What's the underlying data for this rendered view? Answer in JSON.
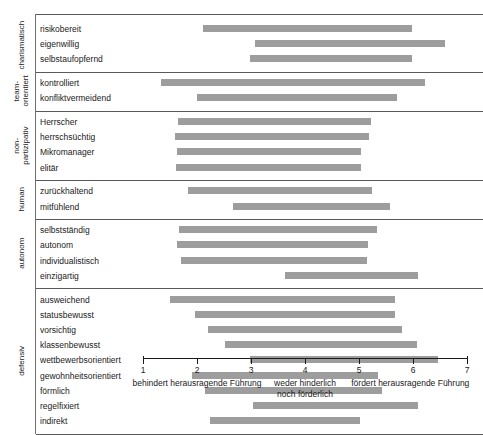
{
  "chart_data": {
    "type": "bar",
    "orientation": "horizontal",
    "subtype": "floating-range-bar",
    "title": "",
    "xlabel": "",
    "ylabel": "",
    "xlim": [
      1,
      7
    ],
    "grid": false,
    "legend": null,
    "bar_color": "#9d9d9d",
    "axis": {
      "ticks": [
        1,
        2,
        3,
        4,
        5,
        6,
        7
      ],
      "tick_labels": [
        "1",
        "2",
        "3",
        "4",
        "5",
        "6",
        "7"
      ],
      "captions": [
        {
          "text": "behindert herausragende Führung",
          "anchor_value": 2.0
        },
        {
          "text": "weder hinderlich\nnoch förderlich",
          "anchor_value": 4.0
        },
        {
          "text": "fördert herausragende Führung",
          "anchor_value": 5.95
        }
      ]
    },
    "groups": [
      {
        "name": "charismatisch",
        "items": [
          {
            "label": "risikobereit",
            "start": 2.11,
            "end": 5.98
          },
          {
            "label": "eigenwillig",
            "start": 3.07,
            "end": 6.59
          },
          {
            "label": "selbstaufopfernd",
            "start": 2.98,
            "end": 5.98
          }
        ]
      },
      {
        "name": "team-\norientiert",
        "items": [
          {
            "label": "kontrolliert",
            "start": 1.33,
            "end": 6.22
          },
          {
            "label": "konfliktvermeidend",
            "start": 2.0,
            "end": 5.7
          }
        ]
      },
      {
        "name": "non-\npartizipativ",
        "items": [
          {
            "label": "Herrscher",
            "start": 1.65,
            "end": 5.22
          },
          {
            "label": "herrschsüchtig",
            "start": 1.59,
            "end": 5.19
          },
          {
            "label": "Mikromanager",
            "start": 1.63,
            "end": 5.04
          },
          {
            "label": "elitär",
            "start": 1.61,
            "end": 5.04
          }
        ]
      },
      {
        "name": "human",
        "items": [
          {
            "label": "zurückhaltend",
            "start": 1.83,
            "end": 5.24
          },
          {
            "label": "mitfühlend",
            "start": 2.67,
            "end": 5.57
          }
        ]
      },
      {
        "name": "autonom",
        "items": [
          {
            "label": "selbstständig",
            "start": 1.67,
            "end": 5.33
          },
          {
            "label": "autonom",
            "start": 1.63,
            "end": 5.17
          },
          {
            "label": "individualistisch",
            "start": 1.7,
            "end": 5.15
          },
          {
            "label": "einzigartig",
            "start": 3.63,
            "end": 6.09
          }
        ]
      },
      {
        "name": "defensiv",
        "items": [
          {
            "label": "ausweichend",
            "start": 1.5,
            "end": 5.67
          },
          {
            "label": "statusbewusst",
            "start": 1.96,
            "end": 5.67
          },
          {
            "label": "vorsichtig",
            "start": 2.2,
            "end": 5.8
          },
          {
            "label": "klassenbewusst",
            "start": 2.52,
            "end": 6.07
          },
          {
            "label": "wettbewerbsorientiert",
            "start": 2.98,
            "end": 6.46
          },
          {
            "label": "gewohnheitsorientiert",
            "start": 1.91,
            "end": 5.35
          },
          {
            "label": "förmlich",
            "start": 2.15,
            "end": 5.43
          },
          {
            "label": "regelfixiert",
            "start": 3.04,
            "end": 6.09
          },
          {
            "label": "indirekt",
            "start": 2.24,
            "end": 5.02
          }
        ]
      }
    ]
  }
}
